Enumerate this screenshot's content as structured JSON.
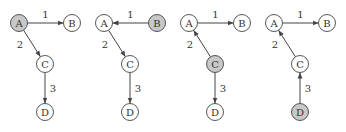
{
  "colors": {
    "highlight_fill": "#c8c8c8",
    "node_fill": "#ffffff",
    "stroke": "#444444",
    "text": "#333333"
  },
  "nodes": {
    "A": {
      "label": "A",
      "x": 19,
      "y": 23
    },
    "B": {
      "label": "B",
      "x": 72,
      "y": 23
    },
    "C": {
      "label": "C",
      "x": 45,
      "y": 64
    },
    "D": {
      "label": "D",
      "x": 45,
      "y": 112
    }
  },
  "panels": [
    {
      "offset_x": 0,
      "highlighted": "A",
      "edges": [
        {
          "from": "A",
          "to": "B",
          "label": "1"
        },
        {
          "from": "A",
          "to": "C",
          "label": "2"
        },
        {
          "from": "C",
          "to": "D",
          "label": "3"
        }
      ]
    },
    {
      "offset_x": 85,
      "highlighted": "B",
      "edges": [
        {
          "from": "B",
          "to": "A",
          "label": "1"
        },
        {
          "from": "A",
          "to": "C",
          "label": "2"
        },
        {
          "from": "C",
          "to": "D",
          "label": "3"
        }
      ]
    },
    {
      "offset_x": 170,
      "highlighted": "C",
      "edges": [
        {
          "from": "A",
          "to": "B",
          "label": "1"
        },
        {
          "from": "C",
          "to": "A",
          "label": "2"
        },
        {
          "from": "C",
          "to": "D",
          "label": "3"
        }
      ]
    },
    {
      "offset_x": 255,
      "highlighted": "D",
      "edges": [
        {
          "from": "A",
          "to": "B",
          "label": "1"
        },
        {
          "from": "C",
          "to": "A",
          "label": "2"
        },
        {
          "from": "D",
          "to": "C",
          "label": "3"
        }
      ]
    }
  ]
}
